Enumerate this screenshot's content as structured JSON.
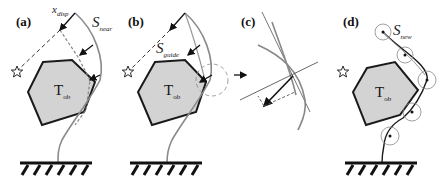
{
  "figure": {
    "panels": [
      {
        "id": "a",
        "label": "(a)",
        "obstacle": "T",
        "obstacle_sub": "ob",
        "symbols": [
          {
            "main": "x",
            "sub": "disp"
          },
          {
            "main": "S",
            "sub": "near"
          }
        ]
      },
      {
        "id": "b",
        "label": "(b)",
        "obstacle": "T",
        "obstacle_sub": "ob",
        "symbols": [
          {
            "main": "S",
            "sub": "guide"
          }
        ]
      },
      {
        "id": "c",
        "label": "(c)"
      },
      {
        "id": "d",
        "label": "(d)",
        "obstacle": "T",
        "obstacle_sub": "ob",
        "symbols": [
          {
            "main": "S",
            "sub": "new"
          }
        ]
      }
    ],
    "icons": [
      "star-icon",
      "ground-hatch-icon",
      "arrow-icon"
    ],
    "colors": {
      "obstacle_fill": "#d3d3d3",
      "outline": "#1a1a1a",
      "curve": "#8a8a8a",
      "dashed": "#555555"
    }
  }
}
